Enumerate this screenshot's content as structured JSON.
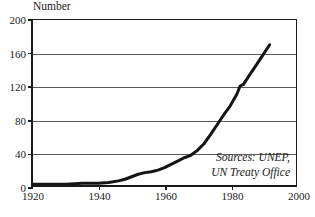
{
  "chart_data": {
    "type": "line",
    "title": "",
    "subtitle": "",
    "xlabel": "",
    "ylabel": "Number",
    "xlim": [
      1920,
      2000
    ],
    "ylim": [
      0,
      200
    ],
    "grid": true,
    "legend": false,
    "x_ticks": [
      "1920",
      "1940",
      "1960",
      "1980",
      "2000"
    ],
    "y_ticks": [
      "0",
      "40",
      "80",
      "120",
      "160",
      "200"
    ],
    "x_tick_values": [
      1920,
      1940,
      1960,
      1980,
      2000
    ],
    "y_tick_values": [
      0,
      40,
      80,
      120,
      160,
      200
    ],
    "annotations": [
      {
        "name": "source-note",
        "line1": "Sources: UNEP,",
        "line2": "UN Treaty Office"
      }
    ],
    "series": [
      {
        "name": "International environmental treaties",
        "color": "#141414",
        "x": [
          1920,
          1925,
          1930,
          1935,
          1940,
          1943,
          1946,
          1948,
          1950,
          1952,
          1954,
          1956,
          1958,
          1960,
          1962,
          1964,
          1966,
          1968,
          1970,
          1972,
          1974,
          1976,
          1978,
          1980,
          1982,
          1983,
          1984,
          1986,
          1988,
          1990,
          1992
        ],
        "values": [
          1,
          1,
          1,
          2,
          2,
          3,
          5,
          7,
          10,
          13,
          15,
          16,
          18,
          21,
          25,
          29,
          33,
          36,
          42,
          50,
          61,
          73,
          85,
          96,
          110,
          120,
          122,
          134,
          146,
          158,
          170
        ]
      }
    ]
  },
  "colors": {
    "series": "#141414",
    "axis": "#1a1a1a",
    "grid": "#5a5a5a",
    "background": "#ffffff"
  }
}
